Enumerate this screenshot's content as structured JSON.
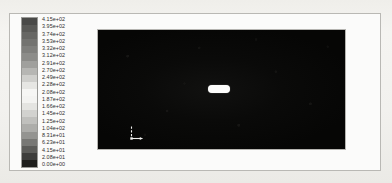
{
  "figure": {
    "kind": "cfd-contour-plot",
    "background_color": "#f3f2ef",
    "frame_border_color": "#b9b8b4"
  },
  "legend": {
    "name": "contour-colorbar",
    "orientation": "vertical",
    "levels": 21,
    "labels": [
      "4.15e+02",
      "3.95e+02",
      "3.74e+02",
      "3.53e+02",
      "3.32e+02",
      "3.12e+02",
      "2.91e+02",
      "2.70e+02",
      "2.49e+02",
      "2.28e+02",
      "2.08e+02",
      "1.87e+02",
      "1.66e+02",
      "1.45e+02",
      "1.25e+02",
      "1.04e+02",
      "8.31e+01",
      "6.23e+01",
      "4.15e+01",
      "2.08e+01",
      "0.00e+00"
    ],
    "band_colors": [
      "#4a4a48",
      "#5a5a57",
      "#676764",
      "#737370",
      "#7f7f7c",
      "#8c8c89",
      "#a0a09d",
      "#b6b6b3",
      "#cfcfcc",
      "#e6e6e3",
      "#f6f6f4",
      "#f3f3f1",
      "#e4e4e1",
      "#d2d2cf",
      "#c0c0bd",
      "#adadaa",
      "#949491",
      "#787875",
      "#5c5c59",
      "#3d3d3b",
      "#1e1e1c"
    ]
  },
  "plot": {
    "name": "contour-plot-canvas",
    "field_color": "#070707",
    "object": {
      "name": "body-object",
      "shape": "capsule",
      "color": "#fdfdfc"
    },
    "axis_triad": {
      "name": "axis-triad-marker",
      "color": "#f2f2f0"
    }
  },
  "chart_data": {
    "type": "heatmap",
    "title": "",
    "xlabel": "",
    "ylabel": "",
    "colorbar_label": "",
    "colormap": "grayscale-rainbow",
    "legend_position": "left",
    "grid": false,
    "levels": [
      415.0,
      395.0,
      374.0,
      353.0,
      332.0,
      312.0,
      291.0,
      270.0,
      249.0,
      228.0,
      208.0,
      187.0,
      166.0,
      145.0,
      125.0,
      104.0,
      83.1,
      62.3,
      41.5,
      20.8,
      0.0
    ],
    "tick_labels": [
      "4.15e+02",
      "3.95e+02",
      "3.74e+02",
      "3.53e+02",
      "3.32e+02",
      "3.12e+02",
      "2.91e+02",
      "2.70e+02",
      "2.49e+02",
      "2.28e+02",
      "2.08e+02",
      "1.87e+02",
      "1.66e+02",
      "1.45e+02",
      "1.25e+02",
      "1.04e+02",
      "8.31e+01",
      "6.23e+01",
      "4.15e+01",
      "2.08e+01",
      "0.00e+00"
    ],
    "zlim": [
      0.0,
      415.0
    ],
    "field_description": "near-uniform low-value dark field with a white capsule-shaped body near center",
    "annotations": [
      "axis triad marker at lower-left of domain"
    ]
  }
}
